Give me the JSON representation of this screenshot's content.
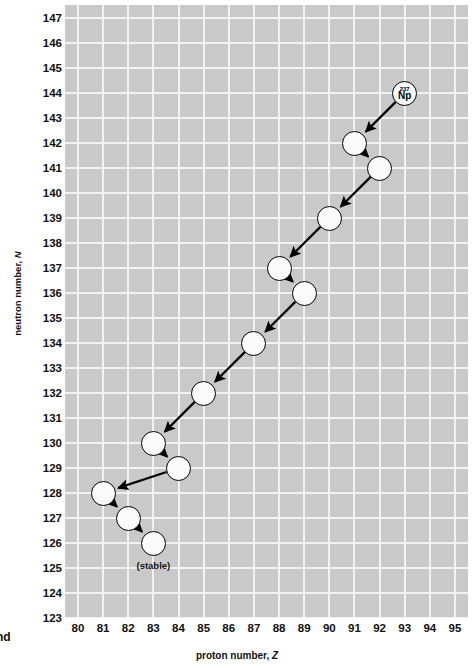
{
  "axes": {
    "x_title_prefix": "proton number, ",
    "x_title_symbol": "Z",
    "y_title_prefix": "neutron number, ",
    "y_title_symbol": "N",
    "x_ticks": [
      "80",
      "81",
      "82",
      "83",
      "84",
      "85",
      "86",
      "87",
      "88",
      "89",
      "90",
      "91",
      "92",
      "93",
      "94",
      "95"
    ],
    "y_ticks": [
      "147",
      "146",
      "145",
      "144",
      "143",
      "142",
      "141",
      "140",
      "139",
      "138",
      "137",
      "136",
      "135",
      "134",
      "133",
      "132",
      "131",
      "130",
      "129",
      "128",
      "127",
      "126",
      "125",
      "124",
      "123"
    ]
  },
  "cropped_margin_text": "nd",
  "annotations": {
    "stable_label": "(stable)",
    "nuclide_mass": "237",
    "nuclide_symbol": "Np"
  },
  "colors": {
    "plot_background": "#c9c9c9",
    "gridline": "#f2f2f2",
    "node_fill": "#fbfbfb",
    "node_stroke": "#000000",
    "arrow": "#000000",
    "text": "#111111",
    "page_background": "#ffffff"
  },
  "chart_data": {
    "type": "scatter",
    "title": "",
    "subtitle": "",
    "xlabel": "proton number, Z",
    "ylabel": "neutron number, N",
    "xlim": [
      79.4,
      95.6
    ],
    "ylim": [
      122.4,
      147.6
    ],
    "grid": true,
    "legend": null,
    "nodes": [
      {
        "id": "n1",
        "Z": 93,
        "N": 144,
        "label_mass": "237",
        "label_symbol": "Np",
        "labelled": true,
        "stable": false
      },
      {
        "id": "n2",
        "Z": 91,
        "N": 142,
        "label_mass": "",
        "label_symbol": "",
        "labelled": false,
        "stable": false
      },
      {
        "id": "n3",
        "Z": 92,
        "N": 141,
        "label_mass": "",
        "label_symbol": "",
        "labelled": false,
        "stable": false
      },
      {
        "id": "n4",
        "Z": 90,
        "N": 139,
        "label_mass": "",
        "label_symbol": "",
        "labelled": false,
        "stable": false
      },
      {
        "id": "n5",
        "Z": 88,
        "N": 137,
        "label_mass": "",
        "label_symbol": "",
        "labelled": false,
        "stable": false
      },
      {
        "id": "n6",
        "Z": 89,
        "N": 136,
        "label_mass": "",
        "label_symbol": "",
        "labelled": false,
        "stable": false
      },
      {
        "id": "n7",
        "Z": 87,
        "N": 134,
        "label_mass": "",
        "label_symbol": "",
        "labelled": false,
        "stable": false
      },
      {
        "id": "n8",
        "Z": 85,
        "N": 132,
        "label_mass": "",
        "label_symbol": "",
        "labelled": false,
        "stable": false
      },
      {
        "id": "n9",
        "Z": 83,
        "N": 130,
        "label_mass": "",
        "label_symbol": "",
        "labelled": false,
        "stable": false
      },
      {
        "id": "n10",
        "Z": 84,
        "N": 129,
        "label_mass": "",
        "label_symbol": "",
        "labelled": false,
        "stable": false
      },
      {
        "id": "n11",
        "Z": 81,
        "N": 128,
        "label_mass": "",
        "label_symbol": "",
        "labelled": false,
        "stable": false
      },
      {
        "id": "n12",
        "Z": 82,
        "N": 127,
        "label_mass": "",
        "label_symbol": "",
        "labelled": false,
        "stable": false
      },
      {
        "id": "n13",
        "Z": 83,
        "N": 126,
        "label_mass": "",
        "label_symbol": "",
        "labelled": false,
        "stable": true
      }
    ],
    "edges": [
      {
        "from": "n1",
        "to": "n2",
        "decay": "alpha"
      },
      {
        "from": "n2",
        "to": "n3",
        "decay": "beta"
      },
      {
        "from": "n3",
        "to": "n4",
        "decay": "alpha"
      },
      {
        "from": "n4",
        "to": "n5",
        "decay": "alpha"
      },
      {
        "from": "n5",
        "to": "n6",
        "decay": "beta"
      },
      {
        "from": "n6",
        "to": "n7",
        "decay": "alpha"
      },
      {
        "from": "n7",
        "to": "n8",
        "decay": "alpha"
      },
      {
        "from": "n8",
        "to": "n9",
        "decay": "alpha"
      },
      {
        "from": "n9",
        "to": "n10",
        "decay": "beta"
      },
      {
        "from": "n10",
        "to": "n11",
        "decay": "alpha"
      },
      {
        "from": "n11",
        "to": "n12",
        "decay": "beta"
      },
      {
        "from": "n12",
        "to": "n13",
        "decay": "beta"
      }
    ]
  }
}
